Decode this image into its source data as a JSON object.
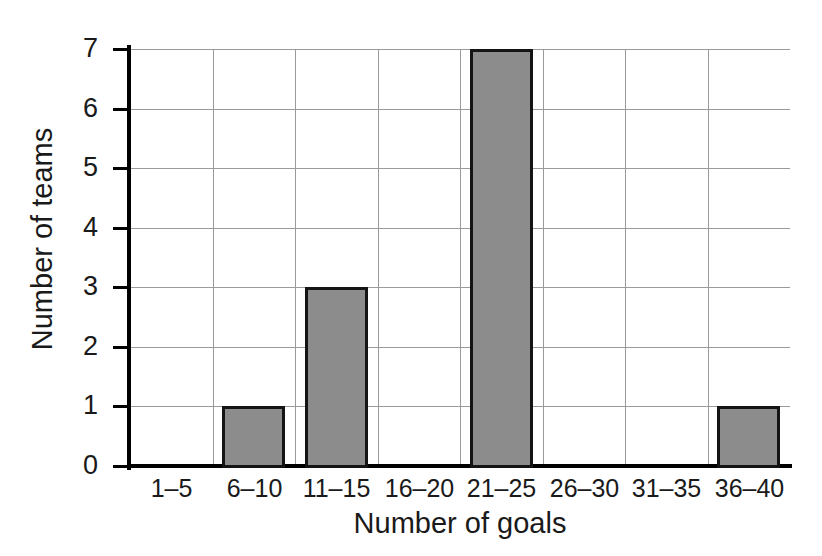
{
  "chart_data": {
    "type": "bar",
    "title": "",
    "xlabel": "Number of goals",
    "ylabel": "Number of teams",
    "categories": [
      "1–5",
      "6–10",
      "11–15",
      "16–20",
      "21–25",
      "26–30",
      "31–35",
      "36–40"
    ],
    "values": [
      0,
      1,
      3,
      0,
      7,
      0,
      0,
      1
    ],
    "ylim": [
      0,
      7
    ],
    "yticks": [
      0,
      1,
      2,
      3,
      4,
      5,
      6,
      7
    ],
    "ytick_labels": [
      "0",
      "1",
      "2",
      "3",
      "4",
      "5",
      "6",
      "7"
    ],
    "grid": true,
    "legend": "none",
    "bar_fill_color": "#8c8c8c",
    "bar_border_color": "#141414",
    "gridline_color": "#9a9a9a",
    "axis_color": "#000000",
    "background_color": "#ffffff"
  }
}
